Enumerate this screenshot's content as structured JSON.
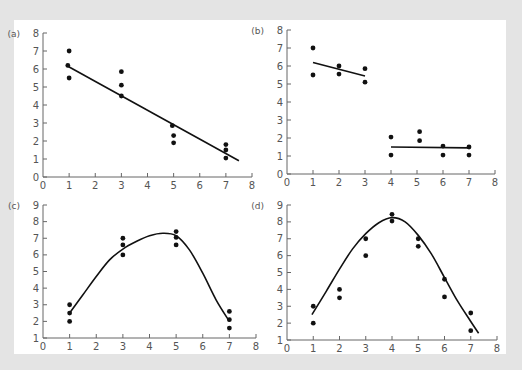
{
  "colors": {
    "background": "#e4e4e4",
    "panel": "#ffffff",
    "axis": "#666666",
    "ink": "#111111",
    "tick_text": "#555555"
  },
  "chart_data": [
    {
      "id": "a",
      "label": "(a)",
      "type": "scatter",
      "box": {
        "x0": 43,
        "x1": 252,
        "y0": 177,
        "y1": 33
      },
      "xlim": [
        0,
        8
      ],
      "ylim": [
        0,
        8
      ],
      "xticks": [
        0,
        1,
        2,
        3,
        4,
        5,
        6,
        7,
        8
      ],
      "yticks": [
        0,
        1,
        2,
        3,
        4,
        5,
        6,
        7,
        8
      ],
      "points": [
        [
          1,
          7
        ],
        [
          0.95,
          6.2
        ],
        [
          1,
          5.5
        ],
        [
          3,
          5.85
        ],
        [
          3,
          5.1
        ],
        [
          3,
          4.5
        ],
        [
          4.95,
          2.85
        ],
        [
          5,
          2.3
        ],
        [
          5,
          1.9
        ],
        [
          7,
          1.8
        ],
        [
          7,
          1.5
        ],
        [
          7,
          1.05
        ]
      ],
      "fits": [
        {
          "kind": "line",
          "points": [
            [
              0.95,
              6.15
            ],
            [
              7.5,
              0.9
            ]
          ]
        }
      ]
    },
    {
      "id": "b",
      "label": "(b)",
      "type": "scatter",
      "box": {
        "x0": 287,
        "x1": 495,
        "y0": 174,
        "y1": 30
      },
      "xlim": [
        0,
        8
      ],
      "ylim": [
        0,
        8
      ],
      "xticks": [
        0,
        1,
        2,
        3,
        4,
        5,
        6,
        7,
        8
      ],
      "yticks": [
        0,
        1,
        2,
        3,
        4,
        5,
        6,
        7,
        8
      ],
      "points": [
        [
          1,
          7
        ],
        [
          1,
          5.5
        ],
        [
          2,
          6
        ],
        [
          2,
          5.55
        ],
        [
          3,
          5.85
        ],
        [
          3,
          5.1
        ],
        [
          4,
          2.05
        ],
        [
          4,
          1.05
        ],
        [
          5.1,
          2.35
        ],
        [
          5.1,
          1.85
        ],
        [
          6,
          1.55
        ],
        [
          6,
          1.05
        ],
        [
          7,
          1.5
        ],
        [
          7,
          1.05
        ]
      ],
      "fits": [
        {
          "kind": "line",
          "points": [
            [
              1,
              6.2
            ],
            [
              3,
              5.45
            ]
          ]
        },
        {
          "kind": "line",
          "points": [
            [
              4,
              1.5
            ],
            [
              7,
              1.45
            ]
          ]
        }
      ]
    },
    {
      "id": "c",
      "label": "(c)",
      "type": "scatter",
      "box": {
        "x0": 43,
        "x1": 256,
        "y0": 338,
        "y1": 205
      },
      "xlim": [
        0,
        8
      ],
      "ylim": [
        1,
        9
      ],
      "xticks": [
        0,
        1,
        2,
        3,
        4,
        5,
        6,
        7,
        8
      ],
      "yticks": [
        1,
        2,
        3,
        4,
        5,
        6,
        7,
        8,
        9
      ],
      "points": [
        [
          1,
          3
        ],
        [
          1,
          2.5
        ],
        [
          1,
          2
        ],
        [
          3,
          7
        ],
        [
          3,
          6.6
        ],
        [
          3,
          6
        ],
        [
          5,
          7.4
        ],
        [
          5,
          7.05
        ],
        [
          5,
          6.6
        ],
        [
          7,
          2.6
        ],
        [
          7,
          2.1
        ],
        [
          7,
          1.6
        ]
      ],
      "fits": [
        {
          "kind": "curve",
          "points": [
            [
              1,
              2.5
            ],
            [
              1.5,
              3.6
            ],
            [
              2,
              4.7
            ],
            [
              2.5,
              5.7
            ],
            [
              3,
              6.35
            ],
            [
              3.5,
              6.8
            ],
            [
              4,
              7.15
            ],
            [
              4.5,
              7.3
            ],
            [
              5,
              7.15
            ],
            [
              5.5,
              6.3
            ],
            [
              6,
              4.9
            ],
            [
              6.5,
              3.3
            ],
            [
              7,
              2.0
            ]
          ]
        }
      ]
    },
    {
      "id": "d",
      "label": "(d)",
      "type": "scatter",
      "box": {
        "x0": 287,
        "x1": 497,
        "y0": 340,
        "y1": 205
      },
      "xlim": [
        0,
        8
      ],
      "ylim": [
        1,
        9
      ],
      "xticks": [
        0,
        1,
        2,
        3,
        4,
        5,
        6,
        7,
        8
      ],
      "yticks": [
        1,
        2,
        3,
        4,
        5,
        6,
        7,
        8,
        9
      ],
      "points": [
        [
          1,
          3
        ],
        [
          1,
          2
        ],
        [
          2,
          4
        ],
        [
          2,
          3.5
        ],
        [
          3,
          7
        ],
        [
          3,
          6
        ],
        [
          4,
          8.45
        ],
        [
          4,
          8.05
        ],
        [
          5,
          7
        ],
        [
          5,
          6.55
        ],
        [
          6,
          4.6
        ],
        [
          6,
          3.55
        ],
        [
          7,
          2.6
        ],
        [
          7,
          1.55
        ]
      ],
      "fits": [
        {
          "kind": "curve",
          "points": [
            [
              0.95,
              2.5
            ],
            [
              1.5,
              3.9
            ],
            [
              2,
              5.2
            ],
            [
              2.5,
              6.4
            ],
            [
              3,
              7.3
            ],
            [
              3.5,
              7.95
            ],
            [
              4,
              8.25
            ],
            [
              4.5,
              8.0
            ],
            [
              5,
              7.2
            ],
            [
              5.5,
              6.1
            ],
            [
              6,
              4.7
            ],
            [
              6.5,
              3.3
            ],
            [
              7,
              2.1
            ],
            [
              7.3,
              1.4
            ]
          ]
        }
      ]
    }
  ]
}
